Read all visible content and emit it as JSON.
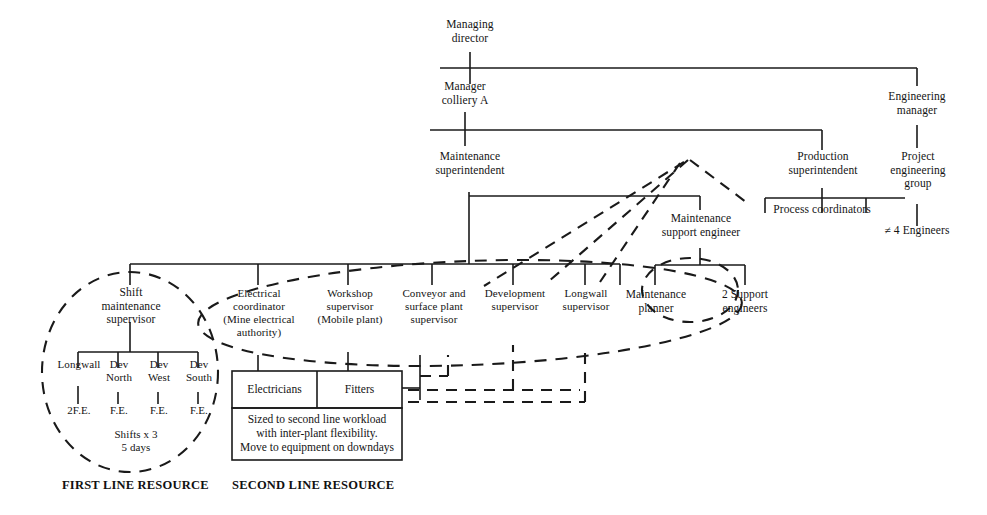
{
  "diagram": {
    "ink_color": "#1a1a1a"
  },
  "nodes": {
    "managing_director": "Managing\ndirector",
    "manager_colliery_a": "Manager\ncolliery A",
    "maintenance_superintendent": "Maintenance\nsuperintendent",
    "engineering_manager": "Engineering\nmanager",
    "project_engineering_group": "Project\nengineering\ngroup",
    "engineers_count": "≠ 4 Engineers",
    "production_superintendent": "Production\nsuperintendent",
    "process_coordinators": "Process coordinators",
    "maintenance_support_engineer": "Maintenance\nsupport engineer",
    "maintenance_planner": "Maintenance\nplanner",
    "support_engineers": "2 Support\nengineers",
    "shift_maintenance_supervisor": "Shift\nmaintenance\nsupervisor",
    "electrical_coordinator": "Electrical\ncoordinator\n(Mine electrical\nauthority)",
    "workshop_supervisor": "Workshop\nsupervisor\n(Mobile plant)",
    "conveyor_surface_plant_supervisor": "Conveyor and\nsurface plant\nsupervisor",
    "development_supervisor": "Development\nsupervisor",
    "longwall_supervisor": "Longwall\nsupervisor"
  },
  "shift_crew": {
    "columns": [
      {
        "name": "Longwall",
        "resource": "2F.E."
      },
      {
        "name": "Dev\nNorth",
        "resource": "F.E."
      },
      {
        "name": "Dev\nWest",
        "resource": "F.E."
      },
      {
        "name": "Dev\nSouth",
        "resource": "F.E."
      }
    ],
    "shifts_note": "Shifts x 3\n5 days"
  },
  "second_line_box": {
    "left_cell": "Electricians",
    "right_cell": "Fitters",
    "note": "Sized to second line workload\nwith inter-plant flexibility.\nMove to equipment on downdays"
  },
  "footer": {
    "first_line": "FIRST LINE RESOURCE",
    "second_line": "SECOND LINE RESOURCE"
  }
}
